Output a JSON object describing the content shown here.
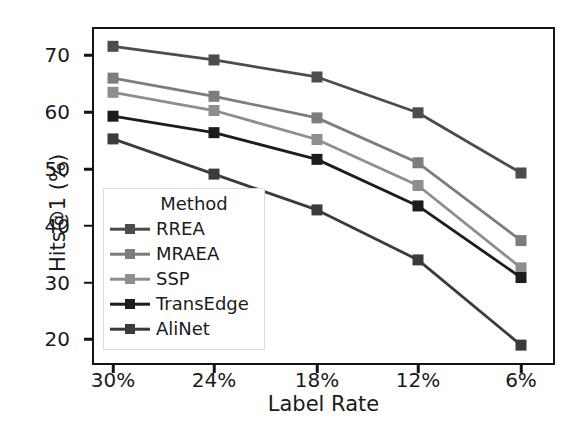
{
  "chart_data": {
    "type": "line",
    "title": "",
    "xlabel": "Label Rate",
    "ylabel": "Hits@1 (%)",
    "categories": [
      "30%",
      "24%",
      "18%",
      "12%",
      "6%"
    ],
    "ylim": [
      15.5,
      75.0
    ],
    "yticks": [
      20,
      30,
      40,
      50,
      60,
      70
    ],
    "ytick_labels": [
      "20",
      "30",
      "40",
      "50",
      "60",
      "70"
    ],
    "grid": false,
    "legend_position": "lower left",
    "legend_title": "Method",
    "marker": "square",
    "series": [
      {
        "name": "RREA",
        "color": "#4c4c4c",
        "values": [
          71.6,
          69.2,
          66.2,
          59.9,
          49.3
        ]
      },
      {
        "name": "MRAEA",
        "color": "#7d7d7d",
        "values": [
          66.0,
          62.8,
          59.0,
          51.1,
          37.4
        ]
      },
      {
        "name": "SSP",
        "color": "#8e8e8e",
        "values": [
          63.5,
          60.3,
          55.2,
          47.1,
          32.6
        ]
      },
      {
        "name": "TransEdge",
        "color": "#1c1c1c",
        "values": [
          59.3,
          56.4,
          51.7,
          43.5,
          30.9
        ]
      },
      {
        "name": "AliNet",
        "color": "#3b3b3b",
        "values": [
          55.3,
          49.1,
          42.8,
          34.0,
          19.0
        ]
      }
    ]
  },
  "axis": {
    "xlabel": "Label Rate",
    "ylabel": "Hits@1 (%)"
  },
  "legend": {
    "title": "Method",
    "entries": [
      {
        "label": "RREA"
      },
      {
        "label": "MRAEA"
      },
      {
        "label": "SSP"
      },
      {
        "label": "TransEdge"
      },
      {
        "label": "AliNet"
      }
    ]
  },
  "style": {
    "frame_color": "#141414",
    "text_color": "#1a1a1a",
    "background": "#ffffff"
  }
}
